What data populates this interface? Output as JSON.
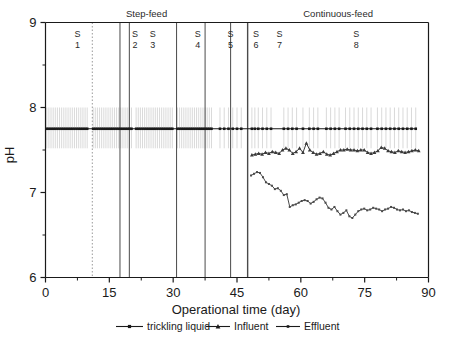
{
  "chart_data": {
    "type": "line",
    "title": "",
    "xlabel": "Operational time (day)",
    "ylabel": "pH",
    "xlim": [
      0,
      90
    ],
    "ylim": [
      6,
      9
    ],
    "xticks": [
      0,
      15,
      30,
      45,
      60,
      75,
      90
    ],
    "xticklabels": [
      "0",
      "15",
      "30",
      "45",
      "60",
      "75",
      "90"
    ],
    "yticks": [
      6,
      7,
      8,
      9
    ],
    "yticklabels": [
      "6",
      "7",
      "8",
      "9"
    ],
    "y_minor_ticks": [
      6.5,
      7.5,
      8.5
    ],
    "grid": false,
    "legend_position": "below-axis",
    "phases": [
      {
        "label": "Step-feed",
        "start_day": 0,
        "end_day": 47.5
      },
      {
        "label": "Continuous-feed",
        "start_day": 47.5,
        "end_day": 90
      }
    ],
    "stages": [
      {
        "label_top": "S",
        "label_bottom": "1",
        "start_day": 0,
        "end_day": 17.5
      },
      {
        "label_top": "S",
        "label_bottom": "2",
        "start_day": 17.5,
        "end_day": 19.7
      },
      {
        "label_top": "S",
        "label_bottom": "3",
        "start_day": 19.7,
        "end_day": 30.8
      },
      {
        "label_top": "S",
        "label_bottom": "4",
        "start_day": 30.8,
        "end_day": 37.5
      },
      {
        "label_top": "S",
        "label_bottom": "5",
        "start_day": 37.5,
        "end_day": 43.5
      },
      {
        "label_top": "S",
        "label_bottom": "6",
        "start_day": 43.5,
        "end_day": 47.5
      },
      {
        "label_top": "S",
        "label_bottom": "7",
        "start_day": 47.5,
        "end_day": 90
      },
      {
        "label_top": "S",
        "label_bottom": "8",
        "start_day": 47.5,
        "end_day": 90
      }
    ],
    "stage_label_days": [
      7.5,
      22.0,
      26.5,
      38.0,
      49.5,
      57.5,
      64.5,
      105.0
    ],
    "divider_days": [
      17.5,
      19.7,
      30.8,
      37.5,
      43.5,
      47.5
    ],
    "dotted_divider_day": 11.0,
    "phase_divider_day": 47.5,
    "series": [
      {
        "name": "trickling liquid",
        "marker": "square",
        "color": "#1a1a1a",
        "has_errorbars": true,
        "errorbar_low": 7.52,
        "errorbar_high": 8.0,
        "x": [
          0.3,
          0.8,
          1.3,
          1.8,
          2.3,
          2.8,
          3.3,
          3.8,
          4.3,
          4.8,
          5.3,
          5.8,
          6.3,
          6.8,
          7.3,
          7.8,
          8.3,
          8.8,
          9.3,
          9.8,
          11.2,
          11.7,
          12.2,
          12.7,
          13.2,
          13.7,
          14.2,
          14.7,
          15.2,
          15.7,
          16.2,
          16.7,
          17.2,
          17.7,
          18.2,
          18.7,
          19.2,
          19.7,
          20.2,
          21.3,
          21.8,
          22.3,
          22.8,
          23.3,
          23.8,
          24.3,
          24.8,
          25.3,
          25.8,
          26.3,
          26.8,
          27.3,
          27.8,
          28.3,
          28.8,
          29.3,
          29.8,
          31.0,
          31.5,
          32.0,
          32.5,
          33.0,
          33.5,
          34.0,
          34.5,
          35.0,
          35.5,
          36.0,
          36.5,
          37.0,
          37.5,
          38.0,
          38.5,
          39.0,
          41.0,
          42.0,
          43.0,
          44.0,
          45.0,
          46.0,
          48.5,
          49.2,
          50.0,
          51.0,
          52.0,
          53.0,
          56.0,
          57.0,
          58.0,
          59.0,
          60.5,
          62.0,
          63.0,
          64.0,
          66.0,
          67.0,
          68.0,
          69.0,
          70.5,
          71.5,
          72.5,
          73.5,
          74.5,
          75.5,
          76.5,
          78.0,
          79.0,
          80.0,
          81.0,
          82.0,
          83.0,
          84.0,
          85.0,
          86.0,
          87.0
        ],
        "y": [
          7.75,
          7.75,
          7.75,
          7.75,
          7.75,
          7.75,
          7.75,
          7.75,
          7.75,
          7.75,
          7.75,
          7.75,
          7.75,
          7.75,
          7.75,
          7.75,
          7.75,
          7.75,
          7.75,
          7.75,
          7.75,
          7.75,
          7.75,
          7.75,
          7.75,
          7.75,
          7.75,
          7.75,
          7.75,
          7.75,
          7.75,
          7.75,
          7.75,
          7.75,
          7.75,
          7.75,
          7.75,
          7.75,
          7.75,
          7.75,
          7.75,
          7.75,
          7.75,
          7.75,
          7.75,
          7.75,
          7.75,
          7.75,
          7.75,
          7.75,
          7.75,
          7.75,
          7.75,
          7.75,
          7.75,
          7.75,
          7.75,
          7.75,
          7.75,
          7.75,
          7.75,
          7.75,
          7.75,
          7.75,
          7.75,
          7.75,
          7.75,
          7.75,
          7.75,
          7.75,
          7.75,
          7.75,
          7.75,
          7.75,
          7.75,
          7.75,
          7.75,
          7.75,
          7.75,
          7.75,
          7.75,
          7.75,
          7.75,
          7.75,
          7.75,
          7.75,
          7.75,
          7.75,
          7.75,
          7.75,
          7.75,
          7.75,
          7.75,
          7.75,
          7.75,
          7.75,
          7.75,
          7.75,
          7.75,
          7.75,
          7.75,
          7.75,
          7.75,
          7.75,
          7.75,
          7.75,
          7.75,
          7.75,
          7.75,
          7.75,
          7.75,
          7.75,
          7.75,
          7.75,
          7.75
        ]
      },
      {
        "name": "Influent",
        "marker": "triangle",
        "color": "#3a3a3a",
        "has_errorbars": false,
        "x": [
          48.5,
          49.3,
          50.1,
          50.9,
          51.7,
          52.5,
          53.3,
          54.1,
          54.9,
          55.7,
          56.5,
          57.3,
          58.1,
          58.9,
          59.7,
          60.5,
          61.3,
          62.1,
          62.9,
          63.7,
          64.5,
          65.3,
          66.1,
          66.9,
          67.7,
          68.5,
          69.3,
          70.1,
          70.9,
          71.7,
          72.5,
          73.3,
          74.1,
          74.9,
          75.7,
          76.5,
          77.3,
          78.1,
          78.9,
          79.7,
          80.5,
          81.3,
          82.1,
          82.9,
          83.7,
          84.5,
          85.3,
          86.1,
          86.9,
          87.7
        ],
        "y": [
          7.44,
          7.45,
          7.46,
          7.45,
          7.47,
          7.46,
          7.48,
          7.47,
          7.46,
          7.5,
          7.52,
          7.5,
          7.46,
          7.48,
          7.52,
          7.47,
          7.58,
          7.5,
          7.47,
          7.45,
          7.46,
          7.48,
          7.45,
          7.44,
          7.46,
          7.48,
          7.5,
          7.5,
          7.51,
          7.5,
          7.5,
          7.49,
          7.5,
          7.5,
          7.47,
          7.46,
          7.47,
          7.49,
          7.53,
          7.52,
          7.49,
          7.48,
          7.47,
          7.49,
          7.48,
          7.47,
          7.48,
          7.49,
          7.5,
          7.49
        ]
      },
      {
        "name": "Effluent",
        "marker": "square",
        "color": "#4a4a4a",
        "has_errorbars": false,
        "x": [
          48.3,
          49.0,
          49.7,
          50.4,
          51.1,
          51.8,
          52.5,
          53.2,
          53.9,
          54.6,
          55.3,
          56.0,
          56.7,
          57.4,
          58.1,
          58.8,
          59.5,
          60.2,
          60.9,
          61.6,
          62.3,
          63.0,
          63.7,
          64.4,
          65.1,
          65.8,
          66.5,
          67.2,
          67.9,
          68.6,
          69.3,
          70.0,
          70.7,
          71.4,
          72.1,
          72.8,
          73.5,
          74.2,
          74.9,
          75.6,
          76.3,
          77.0,
          77.7,
          78.4,
          79.1,
          79.8,
          80.5,
          81.2,
          81.9,
          82.6,
          83.3,
          84.0,
          84.7,
          85.4,
          86.1,
          86.8,
          87.5
        ],
        "y": [
          7.2,
          7.22,
          7.24,
          7.23,
          7.18,
          7.12,
          7.1,
          7.08,
          7.04,
          7.05,
          7.02,
          6.97,
          6.98,
          6.83,
          6.85,
          6.86,
          6.88,
          6.9,
          6.91,
          6.9,
          6.87,
          6.89,
          6.92,
          6.94,
          6.93,
          6.88,
          6.82,
          6.8,
          6.83,
          6.78,
          6.74,
          6.76,
          6.79,
          6.72,
          6.7,
          6.74,
          6.78,
          6.8,
          6.81,
          6.79,
          6.8,
          6.82,
          6.81,
          6.8,
          6.78,
          6.8,
          6.81,
          6.83,
          6.82,
          6.8,
          6.79,
          6.8,
          6.78,
          6.79,
          6.77,
          6.76,
          6.75
        ]
      }
    ],
    "legend": [
      {
        "label": "trickling liquid",
        "marker": "square"
      },
      {
        "label": "Influent",
        "marker": "triangle"
      },
      {
        "label": "Effluent",
        "marker": "square-small"
      }
    ]
  }
}
